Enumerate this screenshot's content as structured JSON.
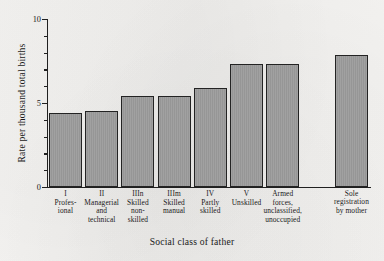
{
  "chart_data": {
    "type": "bar",
    "title": "",
    "xlabel": "Social class of father",
    "ylabel": "Rate per thousand total births",
    "ylim": [
      0,
      10
    ],
    "yticks_major": [
      0,
      5,
      10
    ],
    "ytick_labels": [
      "0",
      "5",
      "10"
    ],
    "yticks_minor": [
      1,
      2,
      3,
      4,
      6,
      7,
      8,
      9
    ],
    "grid": false,
    "legend": null,
    "categories": [
      "I Profes-sional",
      "II Managerial and technical",
      "IIIn Skilled non-skilled",
      "IIIm Skilled manual",
      "IV Partly skilled",
      "V Unskilled",
      "Armed forces, unclassified, unoccupied",
      "Sole registration by mother"
    ],
    "category_lines": [
      [
        "I",
        "Profes-",
        "ional"
      ],
      [
        "II",
        "Managerial",
        "and",
        "technical"
      ],
      [
        "IIIn",
        "Skilled",
        "non-",
        "skilled"
      ],
      [
        "IIIm",
        "Skilled",
        "manual"
      ],
      [
        "IV",
        "Partly",
        "skilled"
      ],
      [
        "V",
        "Unskilled"
      ],
      [
        "Armed",
        "forces,",
        "unclassified,",
        "unoccupied"
      ],
      [
        "Sole",
        "registration",
        "by mother"
      ]
    ],
    "values": [
      4.4,
      4.5,
      5.4,
      5.4,
      5.9,
      7.3,
      7.3,
      7.85
    ],
    "bar_color": "#9c9c9c",
    "bar_edge_color": "#232323"
  }
}
